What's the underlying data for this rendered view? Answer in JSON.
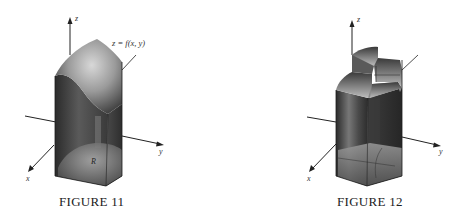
{
  "figures": [
    {
      "id": "figure-11",
      "caption": "FIGURE 11",
      "axes": {
        "x": "x",
        "y": "y",
        "z": "z"
      },
      "surface_label": "z = f(x, y)",
      "region_label": "R",
      "description": "Solid region under smooth surface z = f(x, y) above region R"
    },
    {
      "id": "figure-12",
      "caption": "FIGURE 12",
      "axes": {
        "x": "x",
        "y": "y",
        "z": "z"
      },
      "description": "Approximation of the solid by rectangular boxes (step-like top)"
    }
  ],
  "colors": {
    "background": "#ffffff",
    "solid_dark": "#2a2a2a",
    "solid_mid": "#6e6e6e",
    "solid_light": "#bdbdbd",
    "axis": "#222222"
  }
}
